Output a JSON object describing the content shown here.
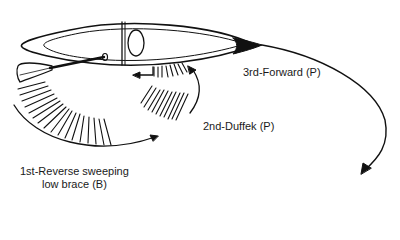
{
  "diagram": {
    "type": "canoe-stroke-sequence",
    "colors": {
      "ink": "#111111",
      "background": "#ffffff"
    },
    "labels": {
      "stroke1_line1": "1st-Reverse sweeping",
      "stroke1_line2": "low brace (B)",
      "stroke2": "2nd-Duffek (P)",
      "stroke3": "3rd-Forward (P)"
    }
  }
}
